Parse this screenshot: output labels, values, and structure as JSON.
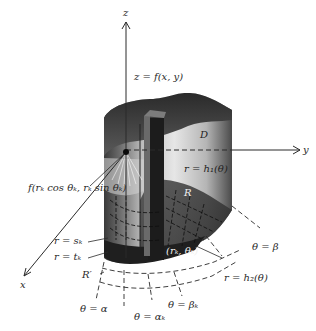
{
  "figure": {
    "colors": {
      "background": "#ffffff",
      "ink": "#2a2a2a",
      "solid_dark": "#2b2b2b",
      "solid_mid": "#8a8a8a",
      "solid_light": "#d8d8d8"
    },
    "axes": {
      "z": "z",
      "y": "y",
      "x": "x"
    },
    "labels": {
      "surface": "z = f(x, y)",
      "region_top": "D",
      "curve_h1": "r = h₁(θ)",
      "point_value": "f(rₖ cos θₖ, rₖ sin θₖ)",
      "region_R": "R",
      "point_polar": "(rₖ, θₖ)",
      "r_sk": "r = sₖ",
      "r_tk": "r = tₖ",
      "region_R_prime": "R′",
      "theta_beta": "θ = β",
      "curve_h2": "r = h₂(θ)",
      "theta_alpha": "θ = α",
      "theta_alpha_k": "θ = αₖ",
      "theta_beta_k": "θ = βₖ"
    }
  }
}
